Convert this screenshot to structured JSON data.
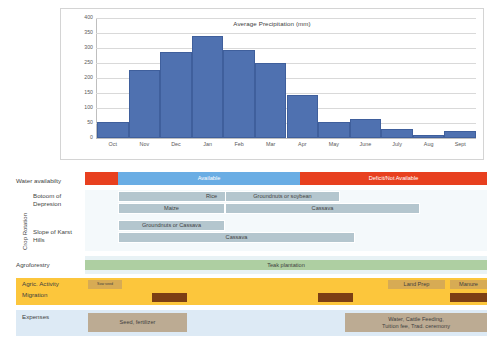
{
  "chart_data": {
    "type": "bar",
    "title": "Average Precipitation (mm)",
    "xlabel": "",
    "ylabel": "",
    "ylim": [
      0,
      400
    ],
    "yticks": [
      0,
      50,
      100,
      150,
      200,
      250,
      300,
      350,
      400
    ],
    "grid": true,
    "legend": "none",
    "bar_color": "#4f71b0",
    "categories": [
      "Oct",
      "Nov",
      "Dec",
      "Jan",
      "Feb",
      "Mar",
      "Apr",
      "May",
      "June",
      "July",
      "Aug",
      "Sept"
    ],
    "values": [
      52,
      226,
      287,
      339,
      294,
      250,
      142,
      55,
      65,
      31,
      10,
      22
    ]
  },
  "rows": {
    "water": {
      "label": "Water availabilty",
      "segments": [
        {
          "name": "deficit-start",
          "text": "",
          "start": 85,
          "end": 118,
          "kind": "red"
        },
        {
          "name": "available",
          "text": "Available",
          "start": 118,
          "end": 300,
          "kind": "blue"
        },
        {
          "name": "deficit-end",
          "text": "Deficit/Not Available",
          "start": 300,
          "end": 487,
          "kind": "red"
        }
      ]
    },
    "crop_rotation": {
      "axis_label": "Crop Rotation",
      "groups": [
        {
          "name": "bottom-of-depression",
          "label": "Botoom of\nDepresion",
          "bars": [
            [
              {
                "text": "Rice",
                "start": 118,
                "end": 305
              },
              {
                "text": "Groundnuts or soybean",
                "start": 225,
                "end": 340
              }
            ],
            [
              {
                "text": "Maize",
                "start": 118,
                "end": 225
              },
              {
                "text": "Cassava",
                "start": 225,
                "end": 420
              }
            ]
          ]
        },
        {
          "name": "slope-of-karst-hills",
          "label": "Slope of Karst\nHills",
          "bars": [
            [
              {
                "text": "Groundnuts or Cassava",
                "start": 118,
                "end": 225
              }
            ],
            [
              {
                "text": "Cassava",
                "start": 118,
                "end": 355
              }
            ]
          ]
        }
      ]
    },
    "agroforestry": {
      "label": "Agroforestry",
      "segments": [
        {
          "text": "Teak plantation",
          "start": 85,
          "end": 487
        }
      ]
    },
    "agric_activity": {
      "label": "Agric. Activity",
      "segments": [
        {
          "text": "Sow seed",
          "start": 88,
          "end": 122
        },
        {
          "text": "Land Prep",
          "start": 388,
          "end": 445
        },
        {
          "text": "Manure",
          "start": 450,
          "end": 487
        }
      ]
    },
    "migration": {
      "label": "Migration",
      "segments": [
        {
          "text": "",
          "start": 152,
          "end": 187
        },
        {
          "text": "",
          "start": 318,
          "end": 353
        },
        {
          "text": "",
          "start": 450,
          "end": 487
        }
      ]
    },
    "expenses": {
      "label": "Expenses",
      "segments": [
        {
          "text": "Seed, fertilizer",
          "start": 88,
          "end": 187
        },
        {
          "text": "Water, Cattle Feeding,\nTuition fee, Trad. ceremony",
          "start": 345,
          "end": 487
        }
      ]
    }
  },
  "colors": {
    "bar": "#4f71b0",
    "water_available": "#6aade4",
    "water_deficit": "#e8401f",
    "crop": "#b4c6ce",
    "agroforestry": "#aecfa2",
    "agric_band": "#fcc63c",
    "agric_seg": "#d7ab54",
    "migration": "#7c3f14",
    "expenses_band": "#ddeaf5",
    "expenses_seg": "#bcab93"
  }
}
